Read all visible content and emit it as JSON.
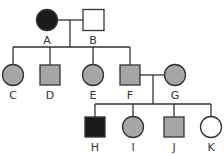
{
  "colors": {
    "affected": "#1a1a1a",
    "carrier": "#a6a6a6",
    "unaffected": "#ffffff",
    "stroke": "#333333"
  },
  "legend_note": "",
  "individuals": [
    {
      "id": "A",
      "sex": "female",
      "status": "affected"
    },
    {
      "id": "B",
      "sex": "male",
      "status": "unaffected"
    },
    {
      "id": "C",
      "sex": "female",
      "status": "carrier"
    },
    {
      "id": "D",
      "sex": "male",
      "status": "carrier"
    },
    {
      "id": "E",
      "sex": "female",
      "status": "carrier"
    },
    {
      "id": "F",
      "sex": "male",
      "status": "carrier"
    },
    {
      "id": "G",
      "sex": "female",
      "status": "carrier"
    },
    {
      "id": "H",
      "sex": "male",
      "status": "affected"
    },
    {
      "id": "I",
      "sex": "female",
      "status": "carrier"
    },
    {
      "id": "J",
      "sex": "male",
      "status": "carrier"
    },
    {
      "id": "K",
      "sex": "female",
      "status": "unaffected"
    }
  ],
  "relationships": [
    {
      "type": "mating",
      "partners": [
        "A",
        "B"
      ],
      "children": [
        "C",
        "D",
        "E",
        "F"
      ]
    },
    {
      "type": "mating",
      "partners": [
        "F",
        "G"
      ],
      "children": [
        "H",
        "I",
        "J",
        "K"
      ]
    }
  ],
  "labels": {
    "A": "A",
    "B": "B",
    "C": "C",
    "D": "D",
    "E": "E",
    "F": "F",
    "G": "G",
    "H": "H",
    "I": "I",
    "J": "J",
    "K": "K"
  }
}
